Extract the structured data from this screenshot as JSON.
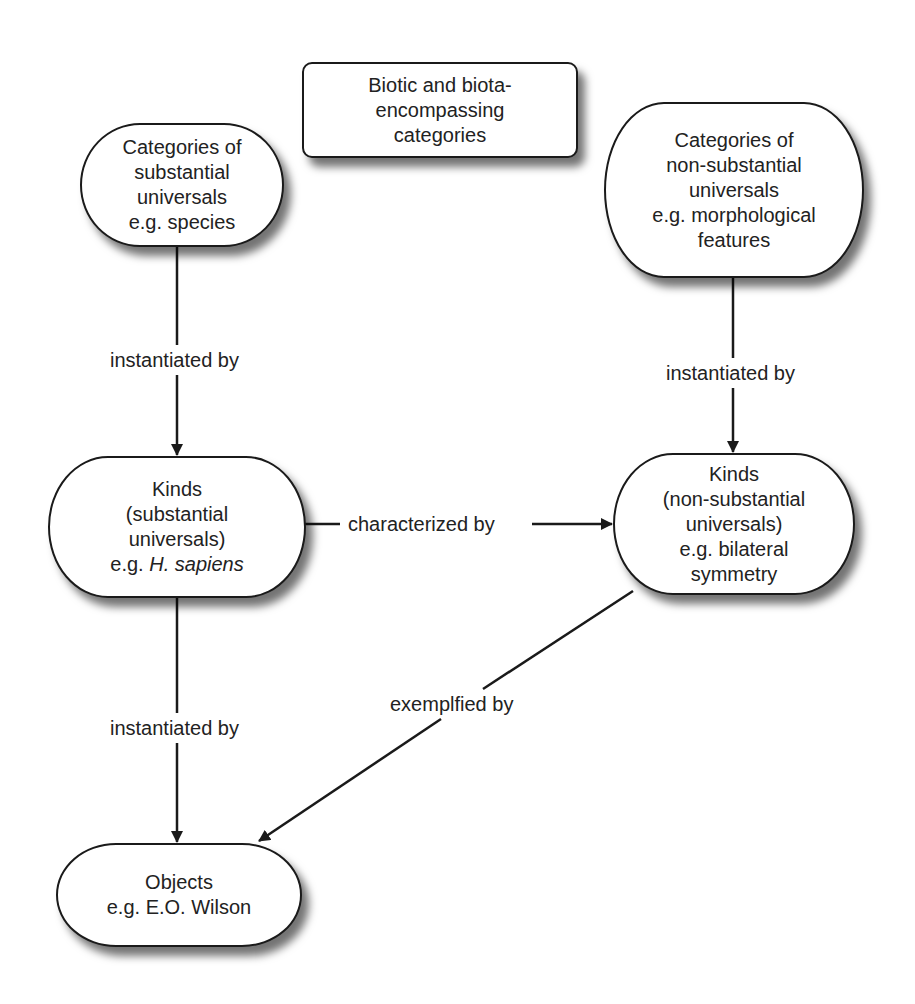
{
  "diagram": {
    "type": "concept-map",
    "nodes": {
      "header": {
        "lines": [
          "Biotic and biota-",
          "encompassing",
          "categories"
        ]
      },
      "cat_substantial": {
        "lines": [
          "Categories of",
          "substantial",
          "universals",
          "e.g. species"
        ]
      },
      "cat_nonsubstantial": {
        "lines": [
          "Categories of",
          "non-substantial",
          "universals",
          "e.g. morphological",
          "features"
        ]
      },
      "kinds_substantial": {
        "lines": [
          "Kinds",
          "(substantial",
          "universals)"
        ],
        "example_prefix": "e.g. ",
        "example_italic": "H. sapiens"
      },
      "kinds_nonsubstantial": {
        "lines": [
          "Kinds",
          "(non-substantial",
          "universals)",
          "e.g. bilateral",
          "symmetry"
        ]
      },
      "objects": {
        "lines": [
          "Objects",
          "e.g. E.O. Wilson"
        ]
      }
    },
    "edges": [
      {
        "from": "cat_substantial",
        "to": "kinds_substantial",
        "label": "instantiated by"
      },
      {
        "from": "cat_nonsubstantial",
        "to": "kinds_nonsubstantial",
        "label": "instantiated by"
      },
      {
        "from": "kinds_substantial",
        "to": "kinds_nonsubstantial",
        "label": "characterized by"
      },
      {
        "from": "kinds_substantial",
        "to": "objects",
        "label": "instantiated by"
      },
      {
        "from": "kinds_nonsubstantial",
        "to": "objects",
        "label": "exemplfied by"
      }
    ],
    "colors": {
      "stroke": "#1a1a1a",
      "fill": "#ffffff",
      "text": "#222222"
    }
  }
}
